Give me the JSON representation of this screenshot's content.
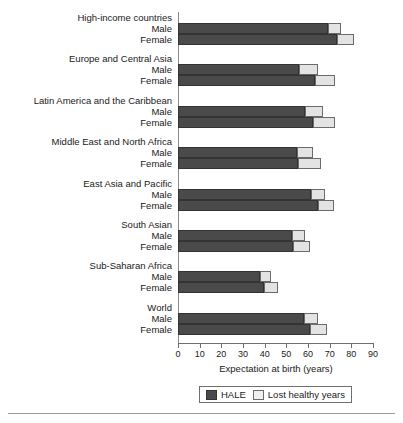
{
  "chart_data": {
    "type": "bar",
    "orientation": "horizontal",
    "stacked": true,
    "title": "",
    "xlabel": "Expectation at birth (years)",
    "ylabel": "",
    "xlim": [
      0,
      90
    ],
    "xticks": [
      0,
      10,
      20,
      30,
      40,
      50,
      60,
      70,
      80,
      90
    ],
    "grid": false,
    "legend_position": "bottom",
    "legend": [
      "HALE",
      "Lost healthy years"
    ],
    "colors": {
      "hale": "#4a4a4a",
      "lost": "#e3e3e3",
      "axis": "#6f6f6f",
      "text": "#1a1a1a"
    },
    "series": [
      {
        "name": "HALE",
        "key": "hale"
      },
      {
        "name": "Lost healthy years",
        "key": "lost"
      }
    ],
    "groups": [
      {
        "label": "High-income countries",
        "rows": [
          {
            "sex": "Male",
            "hale": 69.0,
            "lost": 6.0,
            "total": 75.0
          },
          {
            "sex": "Female",
            "hale": 73.5,
            "lost": 7.5,
            "total": 81.0
          }
        ]
      },
      {
        "label": "Europe and Central Asia",
        "rows": [
          {
            "sex": "Male",
            "hale": 56.0,
            "lost": 8.5,
            "total": 64.5
          },
          {
            "sex": "Female",
            "hale": 63.0,
            "lost": 9.5,
            "total": 72.5
          }
        ]
      },
      {
        "label": "Latin America and the Caribbean",
        "rows": [
          {
            "sex": "Male",
            "hale": 58.5,
            "lost": 8.5,
            "total": 67.0
          },
          {
            "sex": "Female",
            "hale": 62.5,
            "lost": 10.0,
            "total": 72.5
          }
        ]
      },
      {
        "label": "Middle East and North Africa",
        "rows": [
          {
            "sex": "Male",
            "hale": 55.0,
            "lost": 7.5,
            "total": 62.5
          },
          {
            "sex": "Female",
            "hale": 55.5,
            "lost": 10.5,
            "total": 66.0
          }
        ]
      },
      {
        "label": "East Asia and Pacific",
        "rows": [
          {
            "sex": "Male",
            "hale": 61.5,
            "lost": 6.5,
            "total": 68.0
          },
          {
            "sex": "Female",
            "hale": 64.5,
            "lost": 7.5,
            "total": 72.0
          }
        ]
      },
      {
        "label": "South Asian",
        "rows": [
          {
            "sex": "Male",
            "hale": 52.5,
            "lost": 6.0,
            "total": 58.5
          },
          {
            "sex": "Female",
            "hale": 53.0,
            "lost": 8.0,
            "total": 61.0
          }
        ]
      },
      {
        "label": "Sub-Saharan Africa",
        "rows": [
          {
            "sex": "Male",
            "hale": 38.0,
            "lost": 5.0,
            "total": 43.0
          },
          {
            "sex": "Female",
            "hale": 39.5,
            "lost": 6.5,
            "total": 46.0
          }
        ]
      },
      {
        "label": "World",
        "rows": [
          {
            "sex": "Male",
            "hale": 58.0,
            "lost": 6.5,
            "total": 64.5
          },
          {
            "sex": "Female",
            "hale": 61.0,
            "lost": 8.0,
            "total": 69.0
          }
        ]
      }
    ]
  }
}
